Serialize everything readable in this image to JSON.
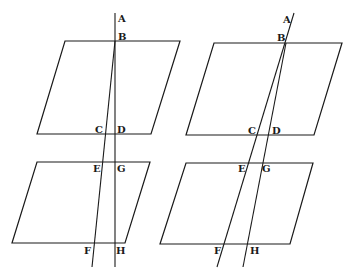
{
  "figure": {
    "left": {
      "labels": {
        "A": "A",
        "B": "B",
        "C": "C",
        "D": "D",
        "E": "E",
        "G": "G",
        "F": "F",
        "H": "H"
      },
      "planes": [
        {
          "name": "upper-plane",
          "points": "65,41 180,41 151,134 37,134"
        },
        {
          "name": "lower-plane",
          "points": "37,162 150,162 125,243 12,243"
        }
      ],
      "lines": [
        {
          "name": "line-AH",
          "x1": 115,
          "y1": 13,
          "x2": 115,
          "y2": 267
        },
        {
          "name": "line-BF",
          "x1": 115,
          "y1": 41,
          "x2": 92,
          "y2": 267
        }
      ]
    },
    "right": {
      "labels": {
        "A": "A",
        "B": "B",
        "C": "C",
        "D": "D",
        "E": "E",
        "G": "G",
        "F": "F",
        "H": "H"
      },
      "planes": [
        {
          "name": "upper-plane",
          "points": "214,43 342,43 314,135 186,135"
        },
        {
          "name": "lower-plane",
          "points": "186,163 313,163 290,244 160,244"
        }
      ],
      "lines": [
        {
          "name": "line-AF",
          "x1": 294,
          "y1": 13,
          "x2": 217,
          "y2": 267
        },
        {
          "name": "line-BH",
          "x1": 286,
          "y1": 43,
          "x2": 243,
          "y2": 267
        }
      ]
    }
  }
}
